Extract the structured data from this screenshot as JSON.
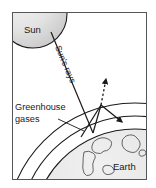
{
  "diagram": {
    "frame": {
      "border_color": "#55565a",
      "background_color": "#ffffff",
      "x": 12,
      "y": 12,
      "width": 135,
      "height": 168
    },
    "labels": {
      "sun": "Sun",
      "suns_rays": "Sun's rays",
      "greenhouse_line1": "Greenhouse",
      "greenhouse_line2": "gases",
      "earth": "Earth"
    },
    "bodies": [
      {
        "name": "sun",
        "label": "Sun",
        "shape": "circle",
        "center_x": 33,
        "center_y": 14,
        "radius": 34,
        "fill_light": "#f2f2f2",
        "fill_dark": "#c9c9c9",
        "stroke": "#1a1a1a"
      },
      {
        "name": "earth",
        "label": "Earth",
        "shape": "circle",
        "center_x": 135,
        "center_y": 232,
        "radius": 103,
        "fill_light": "#ececec",
        "fill_dark": "#d0d0d0",
        "stroke": "#1a1a1a"
      }
    ],
    "atmosphere_layers": [
      {
        "name": "greenhouse-gas-layer-outer",
        "center_x": 135,
        "center_y": 232,
        "radius": 129,
        "stroke": "#1a1a1a"
      },
      {
        "name": "greenhouse-gas-layer-inner",
        "center_x": 135,
        "center_y": 232,
        "radius": 116,
        "stroke": "#1a1a1a"
      }
    ],
    "rays": [
      {
        "name": "incoming-solar-ray",
        "style": "solid",
        "label": "Sun's rays",
        "from_x": 51,
        "from_y": 32,
        "to_x": 93,
        "to_y": 133,
        "arrow": false,
        "rotation_deg": 67
      },
      {
        "name": "reflected-ray-to-atmosphere",
        "style": "solid",
        "from_x": 93,
        "from_y": 133,
        "to_x": 101,
        "to_y": 105,
        "arrow": false
      },
      {
        "name": "reflected-ray-left",
        "style": "solid",
        "from_x": 101,
        "from_y": 105,
        "to_x": 81,
        "to_y": 137,
        "arrow": false
      },
      {
        "name": "escaping-ray-dashed",
        "style": "dashed",
        "from_x": 101,
        "from_y": 105,
        "to_x": 106,
        "to_y": 78,
        "arrow": true
      },
      {
        "name": "back-radiation-ray",
        "style": "solid",
        "from_x": 101,
        "from_y": 105,
        "to_x": 124,
        "to_y": 124,
        "arrow": true
      }
    ],
    "leader_lines": [
      {
        "name": "greenhouse-gases-leader",
        "from_x": 58,
        "from_y": 119,
        "to_x": 84,
        "to_y": 131
      }
    ],
    "colors": {
      "stroke": "#1a1a1a",
      "frame": "#55565a",
      "sun_fill": "#dedede",
      "earth_fill": "#e2e2e2",
      "continent_stroke": "#3a3a3a",
      "background": "#ffffff"
    }
  }
}
